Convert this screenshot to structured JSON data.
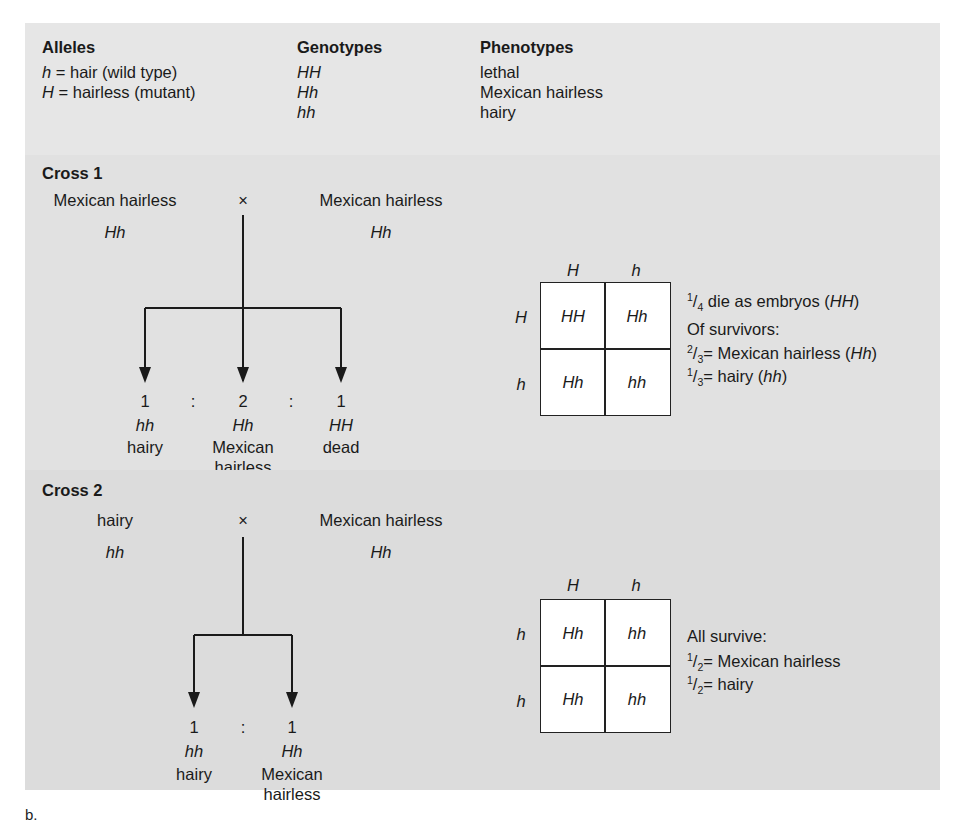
{
  "header": {
    "alleles_title": "Alleles",
    "genotypes_title": "Genotypes",
    "phenotypes_title": "Phenotypes",
    "alleles": [
      {
        "symbol": "h",
        "eq": " = ",
        "desc": "hair (wild type)"
      },
      {
        "symbol": "H",
        "eq": " = ",
        "desc": "hairless (mutant)"
      }
    ],
    "genotypes": [
      "HH",
      "Hh",
      "hh"
    ],
    "phenotypes": [
      "lethal",
      "Mexican hairless",
      "hairy"
    ]
  },
  "cross1": {
    "title": "Cross 1",
    "parent_left": {
      "phenotype": "Mexican hairless",
      "genotype": "Hh"
    },
    "cross_symbol": "×",
    "parent_right": {
      "phenotype": "Mexican hairless",
      "genotype": "Hh"
    },
    "offspring": [
      {
        "ratio": "1",
        "genotype": "hh",
        "phenotype_line1": "hairy",
        "phenotype_line2": ""
      },
      {
        "ratio": "2",
        "genotype": "Hh",
        "phenotype_line1": "Mexican",
        "phenotype_line2": "hairless"
      },
      {
        "ratio": "1",
        "genotype": "HH",
        "phenotype_line1": "dead",
        "phenotype_line2": ""
      }
    ],
    "ratio_sep": ":",
    "punnett": {
      "col_headers": [
        "H",
        "h"
      ],
      "row_headers": [
        "H",
        "h"
      ],
      "cells": [
        [
          "HH",
          "Hh"
        ],
        [
          "Hh",
          "hh"
        ]
      ]
    },
    "notes": {
      "line1": {
        "num": "1",
        "den": "4",
        "text": " die as embryos (",
        "geno": "HH",
        "close": ")"
      },
      "line2": "Of survivors:",
      "line3": {
        "num": "2",
        "den": "3",
        "text": "= Mexican hairless (",
        "geno": "Hh",
        "close": ")"
      },
      "line4": {
        "num": "1",
        "den": "3",
        "text": "= hairy (",
        "geno": "hh",
        "close": ")"
      }
    }
  },
  "cross2": {
    "title": "Cross 2",
    "parent_left": {
      "phenotype": "hairy",
      "genotype": "hh"
    },
    "cross_symbol": "×",
    "parent_right": {
      "phenotype": "Mexican hairless",
      "genotype": "Hh"
    },
    "offspring": [
      {
        "ratio": "1",
        "genotype": "hh",
        "phenotype_line1": "hairy",
        "phenotype_line2": ""
      },
      {
        "ratio": "1",
        "genotype": "Hh",
        "phenotype_line1": "Mexican",
        "phenotype_line2": "hairless"
      }
    ],
    "ratio_sep": ":",
    "punnett": {
      "col_headers": [
        "H",
        "h"
      ],
      "row_headers": [
        "h",
        "h"
      ],
      "cells": [
        [
          "Hh",
          "hh"
        ],
        [
          "Hh",
          "hh"
        ]
      ]
    },
    "notes": {
      "line1": "All survive:",
      "line2": {
        "num": "1",
        "den": "2",
        "text": "= Mexican hairless"
      },
      "line3": {
        "num": "1",
        "den": "2",
        "text": "= hairy"
      }
    }
  },
  "figure_label": "b."
}
